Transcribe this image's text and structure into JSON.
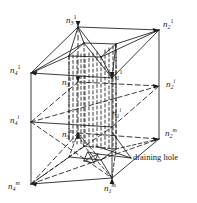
{
  "figure": {
    "kind": "3d-isometric-cuboid-diagram",
    "stroke_color": "#1a1a1a",
    "background_color": "#ffffff"
  },
  "nodes": {
    "top_level": [
      {
        "id": "n3-1",
        "base": "n",
        "sub": "3",
        "sup": "1",
        "x": 66,
        "y": 14
      },
      {
        "id": "n2-1",
        "base": "n",
        "sub": "2",
        "sup": "1",
        "x": 163,
        "y": 18
      },
      {
        "id": "n4-1",
        "base": "n",
        "sub": "4",
        "sup": "1",
        "x": 10,
        "y": 64
      },
      {
        "id": "n1-1",
        "base": "n",
        "sub": "1",
        "sup": "1",
        "x": 112,
        "y": 69
      }
    ],
    "middle_level": [
      {
        "id": "n3-i",
        "base": "n",
        "sub": "3",
        "sup": "i",
        "x": 62,
        "y": 76
      },
      {
        "id": "n2-i",
        "base": "n",
        "sub": "2",
        "sup": "i",
        "x": 166,
        "y": 78
      },
      {
        "id": "n4-i",
        "base": "n",
        "sub": "4",
        "sup": "i",
        "x": 10,
        "y": 114
      },
      {
        "id": "n1-i",
        "base": "n",
        "sub": "1",
        "sup": "i",
        "x": 112,
        "y": 107
      }
    ],
    "bottom_level": [
      {
        "id": "n3-m",
        "base": "n",
        "sub": "3",
        "sup": "m",
        "x": 62,
        "y": 128
      },
      {
        "id": "n2-m",
        "base": "n",
        "sub": "2",
        "sup": "m",
        "x": 165,
        "y": 127
      },
      {
        "id": "n4-m",
        "base": "n",
        "sub": "4",
        "sup": "m",
        "x": 8,
        "y": 180
      },
      {
        "id": "n1-m",
        "base": "n",
        "sub": "1",
        "sup": "m",
        "x": 104,
        "y": 182
      }
    ]
  },
  "annotations": [
    {
      "id": "draining-hole",
      "text": "draining hole",
      "x": 133,
      "y": 157
    }
  ]
}
